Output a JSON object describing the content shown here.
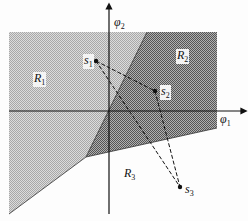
{
  "diagram": {
    "type": "decision-regions",
    "axes": {
      "horizontal": {
        "symbol": "φ",
        "sub": "1"
      },
      "vertical": {
        "symbol": "φ",
        "sub": "2"
      }
    },
    "regions": [
      {
        "name": "R",
        "sub": "1",
        "shading": "light"
      },
      {
        "name": "R",
        "sub": "2",
        "shading": "dark"
      },
      {
        "name": "R",
        "sub": "3",
        "shading": "none"
      }
    ],
    "points": [
      {
        "name": "s",
        "sub": "1"
      },
      {
        "name": "s",
        "sub": "2"
      },
      {
        "name": "s",
        "sub": "3"
      }
    ],
    "colors": {
      "light_region": "#c8c8c8",
      "dark_region": "#8a8a8a",
      "line": "#111111",
      "background": "#fdfdfd"
    }
  }
}
